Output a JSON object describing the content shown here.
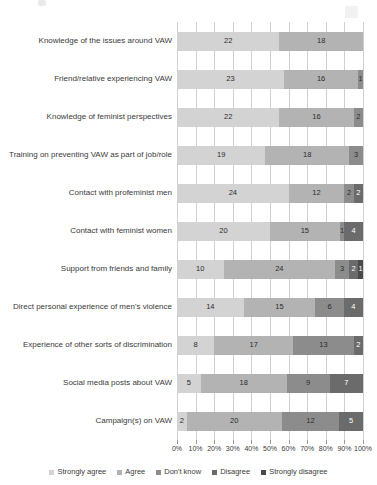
{
  "chart_data": {
    "type": "bar",
    "subtype": "stacked-horizontal-100pct",
    "title": "",
    "xlabel": "",
    "ylabel": "",
    "xlim": [
      0,
      100
    ],
    "grid": true,
    "legend_position": "bottom",
    "x_tick_labels": [
      "0%",
      "10%",
      "20%",
      "30%",
      "40%",
      "50%",
      "60%",
      "70%",
      "80%",
      "90%",
      "100%"
    ],
    "x_ticks": [
      0,
      10,
      20,
      30,
      40,
      50,
      60,
      70,
      80,
      90,
      100
    ],
    "series": [
      {
        "name": "Strongly agree",
        "color": "#d3d3d3",
        "values": [
          22,
          23,
          22,
          19,
          24,
          20,
          10,
          14,
          8,
          5,
          2
        ]
      },
      {
        "name": "Agree",
        "color": "#b3b3b3",
        "values": [
          18,
          16,
          16,
          18,
          12,
          15,
          24,
          15,
          17,
          18,
          20
        ]
      },
      {
        "name": "Don't know",
        "color": "#8c8c8c",
        "values": [
          0,
          1,
          2,
          3,
          2,
          1,
          3,
          6,
          13,
          9,
          12
        ]
      },
      {
        "name": "Disagree",
        "color": "#6b6b6b",
        "values": [
          0,
          0,
          0,
          0,
          2,
          4,
          2,
          4,
          2,
          7,
          5
        ]
      },
      {
        "name": "Strongly disagree",
        "color": "#4a4a4a",
        "values": [
          0,
          0,
          0,
          0,
          0,
          0,
          1,
          0,
          0,
          0,
          0
        ]
      }
    ],
    "categories": [
      "Knowledge of the issues around VAW",
      "Friend/relative experiencing VAW",
      "Knowledge of feminist perspectives",
      "Training on preventing VAW as part of job/role",
      "Contact with profeminist men",
      "Contact with feminist women",
      "Support from friends and family",
      "Direct personal experience of men's violence",
      "Experience of other sorts of discrimination",
      "Social media posts about VAW",
      "Campaign(s) on VAW"
    ],
    "bar_labels": [
      [
        "22",
        "18",
        "",
        "",
        ""
      ],
      [
        "23",
        "16",
        "1",
        "",
        ""
      ],
      [
        "22",
        "16",
        "2",
        "",
        ""
      ],
      [
        "19",
        "18",
        "3",
        "",
        ""
      ],
      [
        "24",
        "12",
        "2",
        "2",
        ""
      ],
      [
        "20",
        "15",
        "1",
        "4",
        ""
      ],
      [
        "10",
        "24",
        "3",
        "2",
        "1"
      ],
      [
        "14",
        "15",
        "6",
        "4",
        ""
      ],
      [
        "8",
        "17",
        "13",
        "2",
        ""
      ],
      [
        "5",
        "18",
        "9",
        "7",
        ""
      ],
      [
        "2",
        "20",
        "12",
        "5",
        ""
      ]
    ]
  },
  "legend": {
    "items": [
      {
        "label": "Strongly agree",
        "color": "#d3d3d3"
      },
      {
        "label": "Agree",
        "color": "#b3b3b3"
      },
      {
        "label": "Don't know",
        "color": "#8c8c8c"
      },
      {
        "label": "Disagree",
        "color": "#6b6b6b"
      },
      {
        "label": "Strongly disagree",
        "color": "#4a4a4a"
      }
    ]
  }
}
